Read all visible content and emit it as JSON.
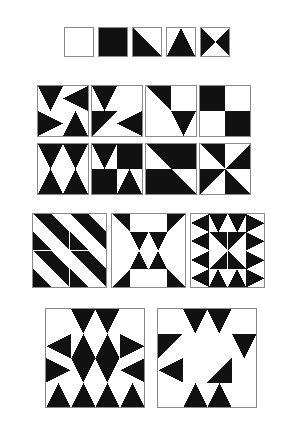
{
  "figure": {
    "name": "geometric-tile-pattern-plate",
    "background_color": "#ffffff",
    "ink_color": "#111111",
    "border_color": "#8a8a8a",
    "width": 292,
    "height": 446
  },
  "legend": {
    "name": "primitive-tile-legend",
    "x": 64,
    "y": 27,
    "tile_size": 30,
    "gap": 4,
    "count": 5,
    "tiles": [
      {
        "label": "blank-tile",
        "type": "blank",
        "rotation": 0
      },
      {
        "label": "solid-tile",
        "type": "solid",
        "rotation": 0
      },
      {
        "label": "half-diagonal-tile",
        "type": "half",
        "rotation": 0
      },
      {
        "label": "mountain-tile",
        "type": "mountain",
        "rotation": 0
      },
      {
        "label": "bowtie-tile",
        "type": "bowtie",
        "rotation": 0
      }
    ]
  },
  "grid_rows": [
    {
      "name": "composition-row-1",
      "x": 37,
      "y": 85,
      "cell_size": 52,
      "gap": 2,
      "tile_size": 26,
      "blocks": [
        {
          "label": "black-diamond-block",
          "cells": [
            {
              "type": "mountain",
              "rotation": 180
            },
            {
              "type": "mountain",
              "rotation": 270
            },
            {
              "type": "mountain",
              "rotation": 90
            },
            {
              "type": "mountain",
              "rotation": 0
            }
          ]
        },
        {
          "label": "offset-arrow-block",
          "cells": [
            {
              "type": "mountain",
              "rotation": 180
            },
            {
              "type": "blank",
              "rotation": 0
            },
            {
              "type": "half",
              "rotation": 90
            },
            {
              "type": "mountain",
              "rotation": 270
            }
          ]
        },
        {
          "label": "double-chevron-block",
          "cells": [
            {
              "type": "half",
              "rotation": 180
            },
            {
              "type": "blank",
              "rotation": 0
            },
            {
              "type": "blank",
              "rotation": 0
            },
            {
              "type": "mountain",
              "rotation": 180
            }
          ]
        },
        {
          "label": "checkerboard-block",
          "cells": [
            {
              "type": "solid",
              "rotation": 0
            },
            {
              "type": "blank",
              "rotation": 0
            },
            {
              "type": "blank",
              "rotation": 0
            },
            {
              "type": "solid",
              "rotation": 0
            }
          ]
        }
      ]
    },
    {
      "name": "composition-row-2",
      "x": 37,
      "y": 143,
      "cell_size": 52,
      "gap": 2,
      "tile_size": 26,
      "blocks": [
        {
          "label": "diamond-over-triangle-block",
          "cells": [
            {
              "type": "mountain",
              "rotation": 180
            },
            {
              "type": "mountain",
              "rotation": 180
            },
            {
              "type": "mountain",
              "rotation": 0
            },
            {
              "type": "mountain",
              "rotation": 0
            }
          ]
        },
        {
          "label": "heart-and-pennant-block",
          "cells": [
            {
              "type": "mountain",
              "rotation": 180
            },
            {
              "type": "solid",
              "rotation": 0
            },
            {
              "type": "solid",
              "rotation": 0
            },
            {
              "type": "mountain",
              "rotation": 0
            }
          ]
        },
        {
          "label": "wide-diagonal-band-block",
          "cells": [
            {
              "type": "half",
              "rotation": 180
            },
            {
              "type": "solid",
              "rotation": 0
            },
            {
              "type": "solid",
              "rotation": 0
            },
            {
              "type": "half",
              "rotation": 0
            }
          ]
        },
        {
          "label": "pinwheel-block",
          "cells": [
            {
              "type": "half",
              "rotation": 180
            },
            {
              "type": "half",
              "rotation": 270
            },
            {
              "type": "half",
              "rotation": 90
            },
            {
              "type": "half",
              "rotation": 0
            }
          ]
        }
      ]
    }
  ],
  "large_row": {
    "name": "composition-row-3",
    "x": 32,
    "y": 213,
    "cell_size": 75,
    "gap": 4,
    "grid": 4,
    "blocks": [
      {
        "label": "diagonal-stripes-block",
        "cells": [
          {
            "type": "half",
            "rotation": 180
          },
          {
            "type": "half",
            "rotation": 0
          },
          {
            "type": "half",
            "rotation": 180
          },
          {
            "type": "half",
            "rotation": 0
          },
          {
            "type": "half",
            "rotation": 0
          },
          {
            "type": "half",
            "rotation": 180
          },
          {
            "type": "half",
            "rotation": 0
          },
          {
            "type": "half",
            "rotation": 180
          },
          {
            "type": "half",
            "rotation": 180
          },
          {
            "type": "half",
            "rotation": 0
          },
          {
            "type": "half",
            "rotation": 180
          },
          {
            "type": "half",
            "rotation": 0
          },
          {
            "type": "half",
            "rotation": 0
          },
          {
            "type": "half",
            "rotation": 180
          },
          {
            "type": "half",
            "rotation": 0
          },
          {
            "type": "half",
            "rotation": 180
          }
        ]
      },
      {
        "label": "concentric-diamond-block",
        "cells": [
          {
            "type": "half",
            "rotation": 180
          },
          {
            "type": "blank",
            "rotation": 0
          },
          {
            "type": "blank",
            "rotation": 0
          },
          {
            "type": "half",
            "rotation": 90
          },
          {
            "type": "blank",
            "rotation": 0
          },
          {
            "type": "mountain",
            "rotation": 180
          },
          {
            "type": "mountain",
            "rotation": 180
          },
          {
            "type": "blank",
            "rotation": 0
          },
          {
            "type": "blank",
            "rotation": 0
          },
          {
            "type": "mountain",
            "rotation": 0
          },
          {
            "type": "mountain",
            "rotation": 0
          },
          {
            "type": "blank",
            "rotation": 0
          },
          {
            "type": "half",
            "rotation": 270
          },
          {
            "type": "blank",
            "rotation": 0
          },
          {
            "type": "blank",
            "rotation": 0
          },
          {
            "type": "half",
            "rotation": 0
          }
        ]
      },
      {
        "label": "eight-point-star-block",
        "cells": [
          {
            "type": "mountain",
            "rotation": 270
          },
          {
            "type": "mountain",
            "rotation": 180
          },
          {
            "type": "mountain",
            "rotation": 180
          },
          {
            "type": "mountain",
            "rotation": 90
          },
          {
            "type": "mountain",
            "rotation": 270
          },
          {
            "type": "half",
            "rotation": 180
          },
          {
            "type": "half",
            "rotation": 90
          },
          {
            "type": "mountain",
            "rotation": 90
          },
          {
            "type": "mountain",
            "rotation": 270
          },
          {
            "type": "half",
            "rotation": 270
          },
          {
            "type": "half",
            "rotation": 0
          },
          {
            "type": "mountain",
            "rotation": 90
          },
          {
            "type": "mountain",
            "rotation": 270
          },
          {
            "type": "mountain",
            "rotation": 0
          },
          {
            "type": "mountain",
            "rotation": 0
          },
          {
            "type": "mountain",
            "rotation": 90
          }
        ]
      }
    ]
  },
  "bottom_row": {
    "name": "composition-row-4",
    "x": 45,
    "y": 308,
    "cell_size": 100,
    "gap": 12,
    "grid": 4,
    "blocks": [
      {
        "label": "zigzag-diamond-chain-block",
        "cells": [
          {
            "type": "blank",
            "rotation": 0
          },
          {
            "type": "mountain",
            "rotation": 180
          },
          {
            "type": "mountain",
            "rotation": 180
          },
          {
            "type": "blank",
            "rotation": 0
          },
          {
            "type": "mountain",
            "rotation": 270
          },
          {
            "type": "mountain",
            "rotation": 0
          },
          {
            "type": "mountain",
            "rotation": 0
          },
          {
            "type": "mountain",
            "rotation": 90
          },
          {
            "type": "mountain",
            "rotation": 90
          },
          {
            "type": "mountain",
            "rotation": 180
          },
          {
            "type": "mountain",
            "rotation": 180
          },
          {
            "type": "mountain",
            "rotation": 270
          },
          {
            "type": "mountain",
            "rotation": 0
          },
          {
            "type": "mountain",
            "rotation": 0
          },
          {
            "type": "mountain",
            "rotation": 0
          },
          {
            "type": "mountain",
            "rotation": 0
          }
        ]
      },
      {
        "label": "interlocked-pinwheel-block",
        "cells": [
          {
            "type": "blank",
            "rotation": 0
          },
          {
            "type": "mountain",
            "rotation": 180
          },
          {
            "type": "mountain",
            "rotation": 180
          },
          {
            "type": "blank",
            "rotation": 0
          },
          {
            "type": "half",
            "rotation": 90
          },
          {
            "type": "blank",
            "rotation": 0
          },
          {
            "type": "blank",
            "rotation": 0
          },
          {
            "type": "mountain",
            "rotation": 180
          },
          {
            "type": "mountain",
            "rotation": 270
          },
          {
            "type": "blank",
            "rotation": 0
          },
          {
            "type": "half",
            "rotation": 270
          },
          {
            "type": "blank",
            "rotation": 0
          },
          {
            "type": "blank",
            "rotation": 0
          },
          {
            "type": "mountain",
            "rotation": 0
          },
          {
            "type": "mountain",
            "rotation": 0
          },
          {
            "type": "blank",
            "rotation": 0
          }
        ]
      }
    ]
  }
}
